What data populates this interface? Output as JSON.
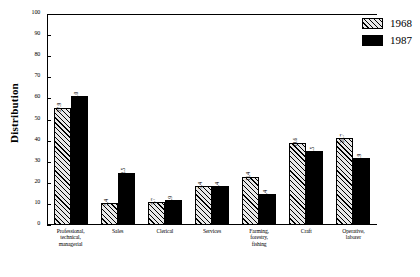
{
  "chart_data": {
    "type": "bar",
    "title": "",
    "xlabel": "",
    "ylabel": "Distribution",
    "ylim": [
      0,
      100
    ],
    "yticks": [
      0,
      10,
      20,
      30,
      40,
      50,
      60,
      70,
      80,
      90,
      100
    ],
    "grid": false,
    "legend_position": "right",
    "categories": [
      "Professional, technical, managerial",
      "Sales",
      "Clerical",
      "Services",
      "Farming, forestry, fishing",
      "Craft",
      "Operative, laborer"
    ],
    "category_lines": [
      [
        "Professional,",
        "technical,",
        "managerial"
      ],
      [
        "Sales"
      ],
      [
        "Clerical"
      ],
      [
        "Services"
      ],
      [
        "Farming,",
        "forestry,",
        "fishing"
      ],
      [
        "Craft"
      ],
      [
        "Operative,",
        "laborer"
      ]
    ],
    "series": [
      {
        "name": "1968",
        "color": "#e8e8e8",
        "pattern": "diagonal-hatch",
        "values": [
          27.9,
          5.4,
          5.7,
          9.4,
          11.4,
          19.6,
          20.7
        ],
        "bar_heights": [
          55.5,
          10.5,
          11.0,
          18.7,
          22.8,
          39.0,
          41.2
        ]
      },
      {
        "name": "1987",
        "color": "#000000",
        "pattern": "solid",
        "values": [
          51.0,
          12.5,
          6.9,
          9.4,
          7.4,
          17.5,
          15.9
        ],
        "bar_heights": [
          61.0,
          24.8,
          12.0,
          18.7,
          14.8,
          35.0,
          31.7
        ]
      }
    ]
  },
  "legend": {
    "items": [
      {
        "label": "1968"
      },
      {
        "label": "1987"
      }
    ]
  }
}
